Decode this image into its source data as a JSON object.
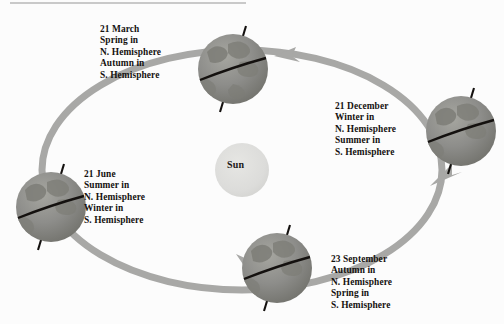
{
  "diagram": {
    "title_visible": false,
    "center_body": {
      "name": "Sun",
      "label": "Sun",
      "color": "#dcdcda",
      "cx": 242,
      "cy": 170,
      "r": 27
    },
    "orbit": {
      "color": "#a8a8a6",
      "stroke_width": 7,
      "cx": 242,
      "cy": 170,
      "rx": 200,
      "ry": 120,
      "direction": "counterclockwise"
    },
    "positions": [
      {
        "id": "march",
        "date": "21 March",
        "lines": [
          "21 March",
          "Spring in",
          "N. Hemisphere",
          "Autumn in",
          "S. Hemisphere"
        ],
        "north_hemisphere_season": "Spring",
        "south_hemisphere_season": "Autumn",
        "earth": {
          "cx": 233,
          "cy": 69,
          "r": 35,
          "axis_tilt_deg": 23.5
        }
      },
      {
        "id": "december",
        "date": "21 December",
        "lines": [
          "21 December",
          "Winter in",
          "N. Hemisphere",
          "Summer in",
          "S. Hemisphere"
        ],
        "north_hemisphere_season": "Winter",
        "south_hemisphere_season": "Summer",
        "earth": {
          "cx": 461,
          "cy": 131,
          "r": 35,
          "axis_tilt_deg": 23.5
        }
      },
      {
        "id": "june",
        "date": "21 June",
        "lines": [
          "21 June",
          "Summer in",
          "N. Hemisphere",
          "Winter in",
          "S. Hemisphere"
        ],
        "north_hemisphere_season": "Summer",
        "south_hemisphere_season": "Winter",
        "earth": {
          "cx": 51,
          "cy": 207,
          "r": 35,
          "axis_tilt_deg": 23.5
        }
      },
      {
        "id": "september",
        "date": "23 September",
        "lines": [
          "23 September",
          "Autumn in",
          "N. Hemisphere",
          "Spring in",
          "S. Hemisphere"
        ],
        "north_hemisphere_season": "Autumn",
        "south_hemisphere_season": "Spring",
        "earth": {
          "cx": 277,
          "cy": 268,
          "r": 35,
          "axis_tilt_deg": 23.5
        }
      }
    ],
    "colors": {
      "background": "#fcfcfc",
      "earth_base": "#8f8f8d",
      "earth_shadow": "#76766f",
      "earth_highlight": "#a2a29c",
      "equator": "#14110f",
      "axis": "#14110f",
      "orbit": "#a8a8a6",
      "sun": "#dcdcda",
      "text": "#14110f",
      "top_rule": "#c9c9c9"
    }
  }
}
